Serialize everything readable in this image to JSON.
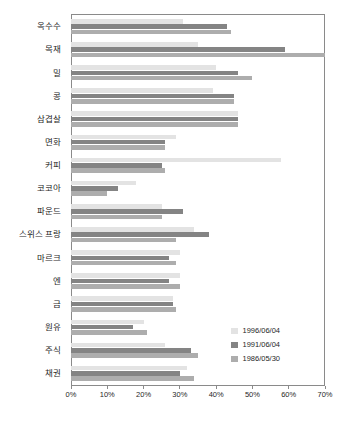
{
  "chart_data": {
    "type": "bar",
    "orientation": "horizontal",
    "title": "",
    "xlabel": "",
    "ylabel": "",
    "xlim": [
      0,
      70
    ],
    "xunit": "%",
    "grid": false,
    "legend_position": "inside-bottom-right",
    "categories": [
      "옥수수",
      "목재",
      "밀",
      "콩",
      "삼겹살",
      "면화",
      "커피",
      "코코아",
      "파운드",
      "스위스 프랑",
      "마르크",
      "엔",
      "금",
      "원유",
      "주식",
      "채권"
    ],
    "xticks": [
      0,
      10,
      20,
      30,
      40,
      50,
      60,
      70
    ],
    "xticklabels": [
      "0%",
      "10%",
      "20%",
      "30%",
      "40%",
      "50%",
      "60%",
      "70%"
    ],
    "series": [
      {
        "name": "1996/06/04",
        "color": "#e3e3e3",
        "values": [
          31,
          35,
          40,
          39,
          46,
          29,
          58,
          18,
          25,
          34,
          30,
          30,
          28,
          20,
          26,
          32
        ]
      },
      {
        "name": "1991/06/04",
        "color": "#848484",
        "values": [
          43,
          59,
          46,
          45,
          46,
          26,
          25,
          13,
          31,
          38,
          27,
          27,
          28,
          17,
          33,
          30
        ]
      },
      {
        "name": "1986/05/30",
        "color": "#adadad",
        "values": [
          44,
          70,
          50,
          45,
          46,
          26,
          26,
          10,
          25,
          29,
          29,
          30,
          29,
          21,
          35,
          34
        ]
      }
    ]
  }
}
